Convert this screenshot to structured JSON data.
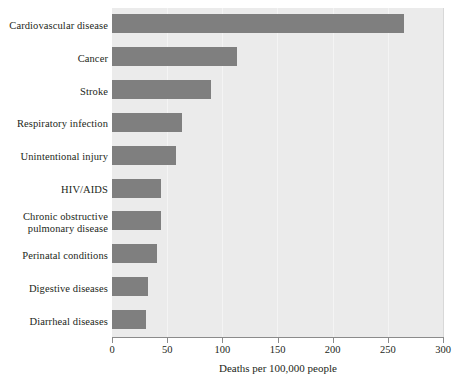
{
  "chart_data": {
    "type": "bar",
    "orientation": "horizontal",
    "title": "",
    "xlabel": "Deaths per 100,000 people",
    "ylabel": "",
    "xlim": [
      0,
      300
    ],
    "xticks": [
      0,
      50,
      100,
      150,
      200,
      250,
      300
    ],
    "xtick_labels": [
      "0",
      "50",
      "100",
      "150",
      "200",
      "250",
      "300"
    ],
    "grid": "vertical-faint",
    "legend": "none",
    "bar_color": "#7f7f7f",
    "plot_background": "#ebebeb",
    "categories": [
      "Cardiovascular disease",
      "Cancer",
      "Stroke",
      "Respiratory infection",
      "Unintentional injury",
      "HIV/AIDS",
      "Chronic obstructive pulmonary disease",
      "Perinatal conditions",
      "Digestive diseases",
      "Diarrheal diseases"
    ],
    "category_labels_display": [
      [
        "Cardiovascular disease"
      ],
      [
        "Cancer"
      ],
      [
        "Stroke"
      ],
      [
        "Respiratory infection"
      ],
      [
        "Unintentional injury"
      ],
      [
        "HIV/AIDS"
      ],
      [
        "Chronic obstructive",
        "pulmonary disease"
      ],
      [
        "Perinatal conditions"
      ],
      [
        "Digestive diseases"
      ],
      [
        "Diarrheal diseases"
      ]
    ],
    "values": [
      265,
      113,
      90,
      63,
      58,
      44,
      44,
      41,
      33,
      31
    ]
  }
}
